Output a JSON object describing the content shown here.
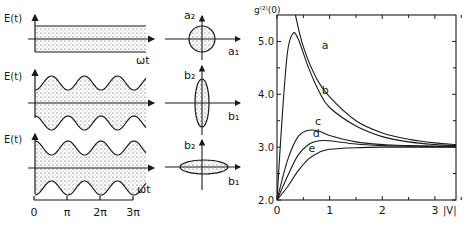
{
  "figure": {
    "left_panel": {
      "y_label": "E(t)",
      "x_label": "ωt",
      "rows": [
        {
          "name": "coherent",
          "description": "constant-amplitude noise band"
        },
        {
          "name": "amplitude-squeezed",
          "description": "noise band narrow at field maxima"
        },
        {
          "name": "phase-squeezed",
          "description": "noise band narrow at field zeros"
        }
      ],
      "tick_labels": [
        "0",
        "π",
        "2π",
        "3π"
      ]
    },
    "phase_space": {
      "rows": [
        {
          "y_label": "a₂",
          "x_label": "a₁",
          "shape": "circle"
        },
        {
          "y_label": "b₂",
          "x_label": "b₁",
          "shape": "vertical-ellipse"
        },
        {
          "y_label": "b₂",
          "x_label": "b₁",
          "shape": "horizontal-ellipse"
        }
      ]
    },
    "right_plot": {
      "y_label": "g⁽²⁾(0)",
      "x_label": "|V|"
    }
  },
  "chart_data": {
    "type": "line",
    "title": "",
    "xlabel": "|V|",
    "ylabel": "g(2)(0)",
    "xlim": [
      0,
      3.4
    ],
    "ylim": [
      2.0,
      5.5
    ],
    "xticks": [
      0,
      1,
      2,
      3
    ],
    "yticks": [
      2.0,
      3.0,
      4.0,
      5.0
    ],
    "xtick_labels": [
      "0",
      "1",
      "2",
      "3"
    ],
    "ytick_labels": [
      "2.0",
      "3.0",
      "4.0",
      "5.0"
    ],
    "grid": false,
    "series": [
      {
        "name": "a",
        "x": [
          0.35,
          0.5,
          0.75,
          1.0,
          1.5,
          2.0,
          2.5,
          3.0,
          3.4
        ],
        "y": [
          5.5,
          4.9,
          4.3,
          3.95,
          3.5,
          3.27,
          3.15,
          3.08,
          3.05
        ]
      },
      {
        "name": "b",
        "x": [
          0.0,
          0.1,
          0.2,
          0.3,
          0.4,
          0.6,
          0.8,
          1.0,
          1.5,
          2.0,
          2.5,
          3.0,
          3.4
        ],
        "y": [
          2.0,
          3.6,
          4.8,
          5.15,
          5.05,
          4.5,
          4.05,
          3.75,
          3.4,
          3.2,
          3.1,
          3.05,
          3.03
        ]
      },
      {
        "name": "c",
        "x": [
          0.0,
          0.2,
          0.4,
          0.6,
          0.8,
          1.0,
          1.5,
          2.0,
          2.5,
          3.0,
          3.4
        ],
        "y": [
          2.0,
          2.75,
          3.2,
          3.32,
          3.3,
          3.22,
          3.1,
          3.05,
          3.03,
          3.02,
          3.02
        ]
      },
      {
        "name": "d",
        "x": [
          0.0,
          0.2,
          0.4,
          0.6,
          0.8,
          1.0,
          1.5,
          2.0,
          2.5,
          3.0,
          3.4
        ],
        "y": [
          2.0,
          2.45,
          2.85,
          3.05,
          3.12,
          3.12,
          3.06,
          3.03,
          3.02,
          3.01,
          3.01
        ]
      },
      {
        "name": "e",
        "x": [
          0.0,
          0.2,
          0.4,
          0.6,
          0.8,
          1.0,
          1.5,
          2.0,
          2.5,
          3.0,
          3.4
        ],
        "y": [
          2.0,
          2.25,
          2.55,
          2.78,
          2.9,
          2.96,
          2.99,
          3.0,
          3.0,
          3.0,
          3.0
        ]
      }
    ],
    "curve_labels": [
      "a",
      "b",
      "c",
      "d",
      "e"
    ]
  }
}
